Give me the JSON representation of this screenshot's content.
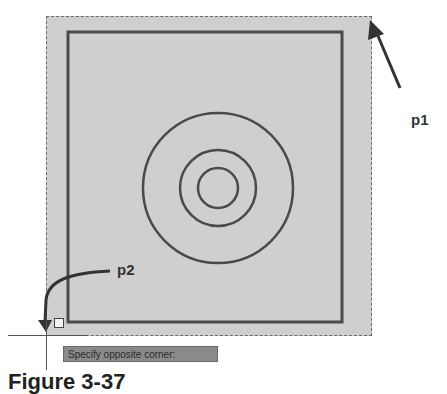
{
  "canvas": {
    "selection_window": {
      "style": "dashed",
      "fill": "#cfcfcf"
    },
    "objects": [
      {
        "type": "rectangle"
      },
      {
        "type": "circle",
        "ring": "outer"
      },
      {
        "type": "circle",
        "ring": "middle"
      },
      {
        "type": "circle",
        "ring": "inner"
      }
    ]
  },
  "points": {
    "p1": "p1",
    "p2": "p2"
  },
  "tooltip": {
    "text": "Specify opposite corner:"
  },
  "caption": {
    "text": "Figure 3-37"
  },
  "colors": {
    "selection_fill": "#cfcfcf",
    "line": "#4a4a4a",
    "tooltip_bg": "#8a8a8a"
  }
}
